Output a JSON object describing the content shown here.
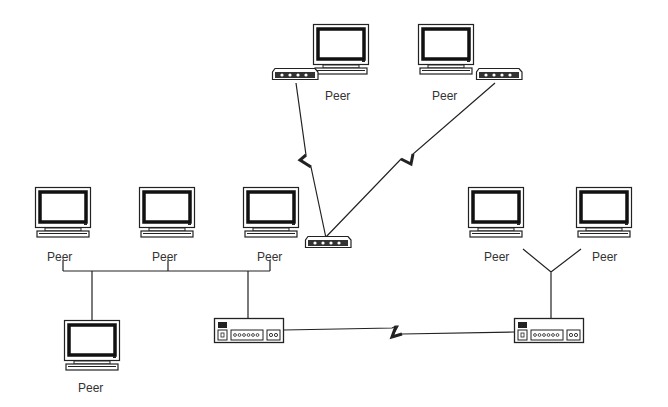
{
  "diagram": {
    "type": "network-topology",
    "nodes": [
      {
        "id": "peer-top-left",
        "label": "Peer",
        "kind": "computer"
      },
      {
        "id": "peer-top-right",
        "label": "Peer",
        "kind": "computer"
      },
      {
        "id": "peer-mid-1",
        "label": "Peer",
        "kind": "computer"
      },
      {
        "id": "peer-mid-2",
        "label": "Peer",
        "kind": "computer"
      },
      {
        "id": "peer-mid-3",
        "label": "Peer",
        "kind": "computer"
      },
      {
        "id": "peer-bottom-left",
        "label": "Peer",
        "kind": "computer"
      },
      {
        "id": "peer-right-1",
        "label": "Peer",
        "kind": "computer"
      },
      {
        "id": "peer-right-2",
        "label": "Peer",
        "kind": "computer"
      },
      {
        "id": "modem-top-left",
        "label": "",
        "kind": "modem"
      },
      {
        "id": "modem-top-right",
        "label": "",
        "kind": "modem"
      },
      {
        "id": "modem-center",
        "label": "",
        "kind": "modem"
      },
      {
        "id": "hub-left",
        "label": "",
        "kind": "hub"
      },
      {
        "id": "hub-right",
        "label": "",
        "kind": "hub"
      }
    ],
    "edges": [
      {
        "from": "modem-top-left",
        "to": "modem-center",
        "style": "wireless-zigzag"
      },
      {
        "from": "modem-top-right",
        "to": "modem-center",
        "style": "wireless-zigzag"
      },
      {
        "from": "hub-left",
        "to": "hub-right",
        "style": "wan-zigzag"
      },
      {
        "from": "peer-mid-1",
        "to": "backbone",
        "style": "line"
      },
      {
        "from": "peer-mid-2",
        "to": "backbone",
        "style": "line"
      },
      {
        "from": "peer-mid-3",
        "to": "backbone",
        "style": "line"
      },
      {
        "from": "peer-bottom-left",
        "to": "backbone",
        "style": "line"
      },
      {
        "from": "hub-left",
        "to": "backbone",
        "style": "line"
      },
      {
        "from": "peer-right-1",
        "to": "hub-right",
        "style": "line"
      },
      {
        "from": "peer-right-2",
        "to": "hub-right",
        "style": "line"
      }
    ],
    "labels": {
      "peer": "Peer"
    }
  }
}
